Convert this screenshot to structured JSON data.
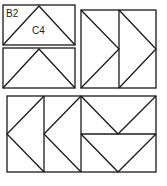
{
  "diagram": {
    "title": "",
    "labels": {
      "b2": "B2",
      "c4": "C4"
    },
    "stroke_color": "#1a1a1a",
    "blocks": [
      {
        "id": "flying-geese-top-1",
        "shape": "rectangle with upward triangle",
        "label": "B2 / C4"
      },
      {
        "id": "flying-geese-top-2",
        "shape": "rectangle with upward triangle"
      },
      {
        "id": "right-arrow-pair",
        "shape": "two squares with right-pointing triangles"
      },
      {
        "id": "bottom-left-arrows",
        "shape": "two rectangles with left-pointing triangles"
      },
      {
        "id": "bottom-right-geese",
        "shape": "two rectangles with downward triangles"
      }
    ]
  }
}
